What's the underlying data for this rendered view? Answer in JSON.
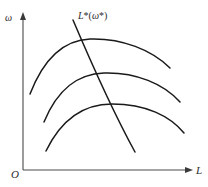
{
  "figure": {
    "type": "economics-diagram",
    "background_color": "#ffffff",
    "stroke_color": "#1a1a1a",
    "axis_color": "#4a4a4a",
    "width": 208,
    "height": 187
  },
  "axes": {
    "y_label": "ω",
    "x_label": "L",
    "origin_label": "O",
    "y_axis_name": "omega-axis",
    "x_axis_name": "l-axis"
  },
  "annotations": {
    "demand_curve_label": "L*(ω*)",
    "demand_curve_label_parts": {
      "base": "L",
      "star1": "*",
      "open_paren": "(",
      "omega": "ω",
      "star2": "*",
      "close_paren": ")"
    }
  },
  "chart_data": {
    "type": "line",
    "title": "",
    "xlabel": "L",
    "ylabel": "ω",
    "grid": false,
    "legend": "none",
    "xlim": [
      0,
      1
    ],
    "ylim": [
      0,
      1
    ],
    "series": [
      {
        "name": "isoprofit-curve-top",
        "description": "Upper concave (inverted-U) indifference/isoprofit curve",
        "path": "M 30,94 C 44,58 64,40 90,39 C 122,38 152,50 170,68"
      },
      {
        "name": "isoprofit-curve-middle",
        "description": "Middle concave (inverted-U) indifference/isoprofit curve",
        "path": "M 44,122 C 58,88 78,74 104,73 C 136,72 164,84 180,102"
      },
      {
        "name": "isoprofit-curve-bottom",
        "description": "Lower concave (inverted-U) indifference/isoprofit curve",
        "path": "M 46,151 C 62,118 84,104 112,104 C 146,104 170,116 184,133"
      },
      {
        "name": "labor-demand-line",
        "description": "Downward-sloping labor demand schedule L*(omega*)",
        "path": "M 73,20 C 90,60 112,110 135,152"
      }
    ]
  }
}
